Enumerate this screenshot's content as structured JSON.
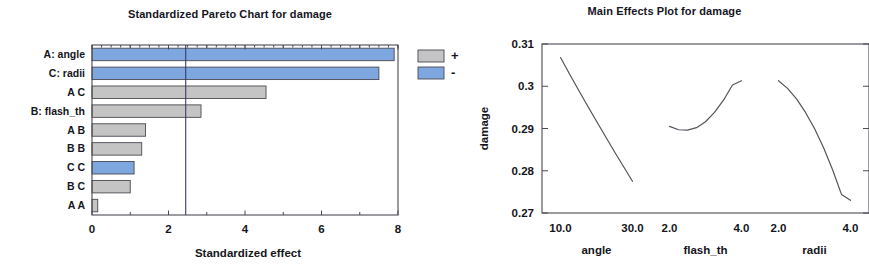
{
  "chart_data": [
    {
      "type": "bar",
      "orientation": "horizontal",
      "title": "Standardized Pareto Chart for damage",
      "xlabel": "Standardized effect",
      "ylabel": "",
      "xlim": [
        0,
        8
      ],
      "xticks": [
        0,
        2,
        4,
        6,
        8
      ],
      "xtick_labels": [
        "0",
        "2",
        "4",
        "6",
        "8"
      ],
      "minor_xticks": [
        1,
        3,
        5,
        7
      ],
      "grid": false,
      "reference_line": 2.45,
      "categories": [
        "A: angle",
        "C: radii",
        "A C",
        "B: flash_th",
        "A B",
        "B B",
        "C C",
        "B C",
        "A A"
      ],
      "values": [
        7.9,
        7.5,
        4.55,
        2.85,
        1.4,
        1.3,
        1.1,
        1.0,
        0.15
      ],
      "signs": [
        "-",
        "-",
        "+",
        "+",
        "+",
        "+",
        "-",
        "+",
        "+"
      ],
      "legend": {
        "position": "right",
        "entries": [
          {
            "label": "+",
            "color": "#c4c4c4",
            "sign": "+"
          },
          {
            "label": "-",
            "color": "#7ea7e0",
            "sign": "-"
          }
        ]
      },
      "colors": {
        "positive": "#c4c4c4",
        "negative": "#7ea7e0"
      }
    },
    {
      "type": "line",
      "title": "Main Effects Plot for damage",
      "xlabel": "",
      "ylabel": "damage",
      "ylim": [
        0.27,
        0.31
      ],
      "yticks": [
        0.27,
        0.28,
        0.29,
        0.3,
        0.31
      ],
      "ytick_labels": [
        "0.27",
        "0.28",
        "0.29",
        "0.3",
        "0.31"
      ],
      "grid": false,
      "panels": [
        {
          "name": "angle",
          "xlim": [
            10.0,
            30.0
          ],
          "xticks": [
            10.0,
            30.0
          ],
          "xtick_labels": [
            "10.0",
            "30.0"
          ],
          "x": [
            10.0,
            12.5,
            15.0,
            17.5,
            20.0,
            22.5,
            25.0,
            27.5,
            30.0
          ],
          "y": [
            0.3068,
            0.3029,
            0.2991,
            0.2954,
            0.2917,
            0.2881,
            0.2845,
            0.281,
            0.2775
          ]
        },
        {
          "name": "flash_th",
          "xlim": [
            2.0,
            4.0
          ],
          "xticks": [
            2.0,
            4.0
          ],
          "xtick_labels": [
            "2.0",
            "4.0"
          ],
          "x": [
            2.0,
            2.25,
            2.5,
            2.75,
            3.0,
            3.25,
            3.5,
            3.75,
            4.0
          ],
          "y": [
            0.2905,
            0.2897,
            0.2896,
            0.2902,
            0.2916,
            0.2938,
            0.2967,
            0.3003,
            0.3013
          ]
        },
        {
          "name": "radii",
          "xlim": [
            2.0,
            4.0
          ],
          "xticks": [
            2.0,
            4.0
          ],
          "xtick_labels": [
            "2.0",
            "4.0"
          ],
          "x": [
            2.0,
            2.25,
            2.5,
            2.75,
            3.0,
            3.25,
            3.5,
            3.75,
            4.0
          ],
          "y": [
            0.3013,
            0.2995,
            0.297,
            0.2938,
            0.29,
            0.2855,
            0.2803,
            0.2744,
            0.273
          ]
        }
      ]
    }
  ]
}
